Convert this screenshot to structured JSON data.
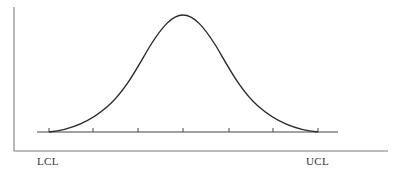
{
  "diagram": {
    "type": "normal-distribution-control-chart",
    "labels": {
      "lower_control_limit": "LCL",
      "upper_control_limit": "UCL"
    },
    "tick_count": 7,
    "colors": {
      "curve": "#2a2a2a",
      "axis": "#777777",
      "baseline": "#444444",
      "text": "#333333"
    }
  }
}
